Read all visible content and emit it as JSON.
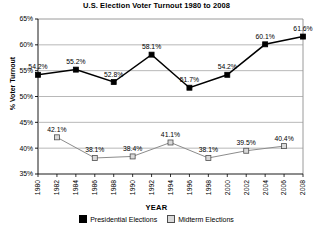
{
  "chart_data": {
    "type": "line",
    "title": "U.S. Election Voter Turnout 1980 to 2008",
    "xlabel": "YEAR",
    "ylabel": "% Voter Turnout",
    "ylim": [
      35,
      65
    ],
    "ytick_step": 5,
    "ytick_labels": [
      "65%",
      "60%",
      "55%",
      "50%",
      "45%",
      "40%",
      "35%"
    ],
    "ytick_values": [
      65,
      60,
      55,
      50,
      45,
      40,
      35
    ],
    "x": [
      1980,
      1982,
      1984,
      1986,
      1988,
      1990,
      1992,
      1994,
      1996,
      1998,
      2000,
      2002,
      2004,
      2006,
      2008
    ],
    "xtick_labels": [
      "1980",
      "1982",
      "1984",
      "1986",
      "1988",
      "1990",
      "1992",
      "1994",
      "1996",
      "1998",
      "2000",
      "2002",
      "2004",
      "2006",
      "2008"
    ],
    "grid": "horizontal",
    "legend_position": "bottom",
    "series": [
      {
        "name": "Presidential Elections",
        "color": "#000000",
        "marker": "filled-square",
        "points": [
          {
            "x": 1980,
            "y": 54.2,
            "label": "54.2%"
          },
          {
            "x": 1984,
            "y": 55.2,
            "label": "55.2%"
          },
          {
            "x": 1988,
            "y": 52.8,
            "label": "52.8%"
          },
          {
            "x": 1992,
            "y": 58.1,
            "label": "58.1%"
          },
          {
            "x": 1996,
            "y": 51.7,
            "label": "51.7%"
          },
          {
            "x": 2000,
            "y": 54.2,
            "label": "54.2%"
          },
          {
            "x": 2004,
            "y": 60.1,
            "label": "60.1%"
          },
          {
            "x": 2008,
            "y": 61.6,
            "label": "61.6%"
          }
        ]
      },
      {
        "name": "Midterm Elections",
        "color": "#d9d9d9",
        "marker": "light-square",
        "points": [
          {
            "x": 1982,
            "y": 42.1,
            "label": "42.1%"
          },
          {
            "x": 1986,
            "y": 38.1,
            "label": "38.1%"
          },
          {
            "x": 1990,
            "y": 38.4,
            "label": "38.4%"
          },
          {
            "x": 1994,
            "y": 41.1,
            "label": "41.1%"
          },
          {
            "x": 1998,
            "y": 38.1,
            "label": "38.1%"
          },
          {
            "x": 2002,
            "y": 39.5,
            "label": "39.5%"
          },
          {
            "x": 2006,
            "y": 40.4,
            "label": "40.4%"
          }
        ]
      }
    ]
  },
  "legend": {
    "items": [
      {
        "label": "Presidential Elections"
      },
      {
        "label": "Midterm Elections"
      }
    ]
  }
}
